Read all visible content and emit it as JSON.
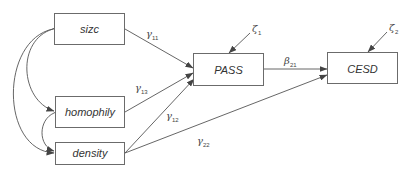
{
  "diagram": {
    "type": "structural-equation-path-diagram",
    "colors": {
      "line": "#555555",
      "box_border": "#6b6b6b",
      "text": "#333333",
      "background": "#ffffff"
    },
    "nodes": {
      "sizc": {
        "label": "sizc"
      },
      "homophily": {
        "label": "homophily"
      },
      "density": {
        "label": "density"
      },
      "pass": {
        "label": "PASS"
      },
      "cesd": {
        "label": "CESD"
      }
    },
    "disturbances": {
      "zeta1": {
        "symbol": "ζ",
        "sub": "1",
        "target": "PASS"
      },
      "zeta2": {
        "symbol": "ζ",
        "sub": "2",
        "target": "CESD"
      }
    },
    "paths": {
      "g11": {
        "symbol": "γ",
        "sub": "11",
        "from": "sizc",
        "to": "PASS"
      },
      "g13": {
        "symbol": "γ",
        "sub": "13",
        "from": "homophily",
        "to": "PASS"
      },
      "g12": {
        "symbol": "γ",
        "sub": "12",
        "from": "density",
        "to": "PASS"
      },
      "g22": {
        "symbol": "γ",
        "sub": "22",
        "from": "density",
        "to": "CESD"
      },
      "b21": {
        "symbol": "β",
        "sub": "21",
        "from": "PASS",
        "to": "CESD"
      }
    },
    "covariances": [
      {
        "between": [
          "sizc",
          "homophily"
        ]
      },
      {
        "between": [
          "sizc",
          "density"
        ]
      },
      {
        "between": [
          "homophily",
          "density"
        ]
      }
    ]
  }
}
